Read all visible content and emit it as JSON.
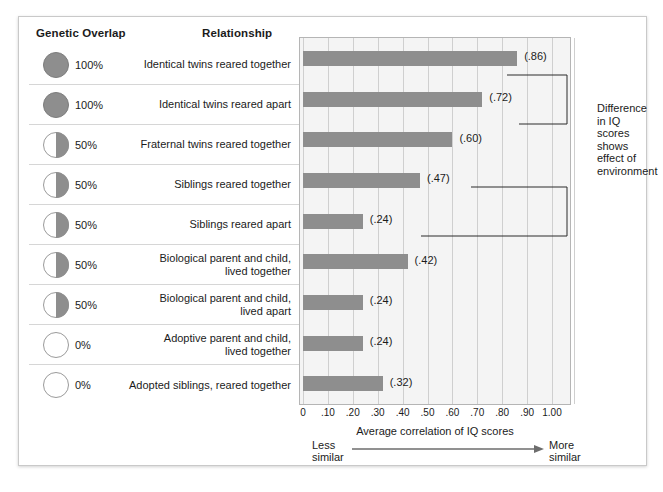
{
  "headers": {
    "genetic_overlap": "Genetic Overlap",
    "relationship": "Relationship"
  },
  "rows": [
    {
      "overlap": "100%",
      "fill": 100,
      "relationship": "Identical twins reared together",
      "value": ".86",
      "label": "(.86)"
    },
    {
      "overlap": "100%",
      "fill": 100,
      "relationship": "Identical twins reared apart",
      "value": ".72",
      "label": "(.72)"
    },
    {
      "overlap": "50%",
      "fill": 50,
      "relationship": "Fraternal twins reared together",
      "value": ".60",
      "label": "(.60)"
    },
    {
      "overlap": "50%",
      "fill": 50,
      "relationship": "Siblings reared together",
      "value": ".47",
      "label": "(.47)"
    },
    {
      "overlap": "50%",
      "fill": 50,
      "relationship": "Siblings reared apart",
      "value": ".24",
      "label": "(.24)"
    },
    {
      "overlap": "50%",
      "fill": 50,
      "relationship": "Biological parent and child,\nlived together",
      "value": ".42",
      "label": "(.42)"
    },
    {
      "overlap": "50%",
      "fill": 50,
      "relationship": "Biological parent and child,\nlived apart",
      "value": ".24",
      "label": "(.24)"
    },
    {
      "overlap": "0%",
      "fill": 0,
      "relationship": "Adoptive parent and child,\nlived together",
      "value": ".24",
      "label": "(.24)"
    },
    {
      "overlap": "0%",
      "fill": 0,
      "relationship": "Adopted siblings, reared together",
      "value": ".32",
      "label": "(.32)"
    }
  ],
  "axis": {
    "title": "Average correlation of IQ scores",
    "ticks": [
      "0",
      ".10",
      ".20",
      ".30",
      ".40",
      ".50",
      ".60",
      ".70",
      ".80",
      ".90",
      "1.00"
    ],
    "less_similar": "Less\nsimilar",
    "more_similar": "More\nsimilar",
    "less_similar_line1": "Less",
    "less_similar_line2": "similar",
    "more_similar_line1": "More",
    "more_similar_line2": "similar"
  },
  "annotation": {
    "text": "Difference in IQ scores shows effect of environment",
    "line1": "Difference",
    "line2": "in IQ",
    "line3": "scores",
    "line4": "shows",
    "line5": "effect of",
    "line6": "environment"
  },
  "colors": {
    "bar": "#8e8e8e",
    "plot_bg": "#f4f4f4",
    "grid": "#cfcfcf",
    "text": "#1b1b1b",
    "rule": "#d6d6d6"
  },
  "chart_data": {
    "type": "bar",
    "orientation": "horizontal",
    "title": "",
    "xlabel": "Average correlation of IQ scores",
    "ylabel": "",
    "xlim": [
      0,
      1.0
    ],
    "xticks": [
      0,
      0.1,
      0.2,
      0.3,
      0.4,
      0.5,
      0.6,
      0.7,
      0.8,
      0.9,
      1.0
    ],
    "grid": true,
    "legend": false,
    "categories": [
      "Identical twins reared together",
      "Identical twins reared apart",
      "Fraternal twins reared together",
      "Siblings reared together",
      "Siblings reared apart",
      "Biological parent and child, lived together",
      "Biological parent and child, lived apart",
      "Adoptive parent and child, lived together",
      "Adopted siblings, reared together"
    ],
    "values": [
      0.86,
      0.72,
      0.6,
      0.47,
      0.24,
      0.42,
      0.24,
      0.24,
      0.32
    ],
    "data_labels": [
      "(.86)",
      "(.72)",
      "(.60)",
      "(.47)",
      "(.24)",
      "(.42)",
      "(.24)",
      "(.24)",
      "(.32)"
    ],
    "genetic_overlap": [
      "100%",
      "100%",
      "50%",
      "50%",
      "50%",
      "50%",
      "50%",
      "0%",
      "0%"
    ],
    "annotations": [
      {
        "text": "Difference in IQ scores shows effect of environment",
        "links": [
          0.86,
          0.72,
          0.47,
          0.24
        ]
      }
    ],
    "axis_endpoints": {
      "left": "Less similar",
      "right": "More similar"
    }
  }
}
